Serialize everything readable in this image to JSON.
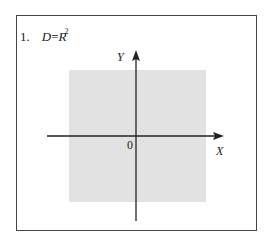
{
  "problem": {
    "number": "1.",
    "lhs": "D",
    "eq": "=",
    "base": "R",
    "exponent": "2"
  },
  "axes": {
    "x_label": "X",
    "y_label": "Y",
    "origin_label": "0"
  },
  "colors": {
    "region_fill": "#e2e2e2",
    "axis": "#222222",
    "frame": "#444444"
  }
}
